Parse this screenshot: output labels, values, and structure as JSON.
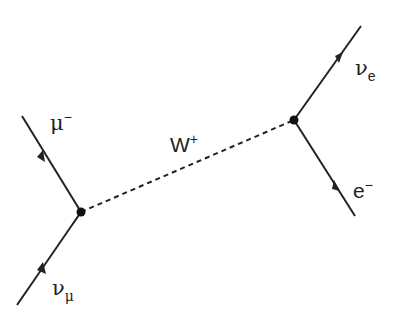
{
  "diagram": {
    "type": "feynman-diagram",
    "colors": {
      "line": "#222222",
      "background": "#ffffff"
    },
    "vertices": [
      {
        "id": "left-vertex",
        "x": 81,
        "y": 212
      },
      {
        "id": "right-vertex",
        "x": 294,
        "y": 120
      }
    ],
    "propagator": {
      "label_main": "W",
      "label_sup": "+",
      "style": "dashed"
    },
    "particles": {
      "muon": {
        "label_main": "μ",
        "label_sup": "−",
        "direction": "outgoing"
      },
      "muon_neutrino": {
        "label_main": "ν",
        "label_sub": "μ",
        "direction": "incoming"
      },
      "electron_neutrino": {
        "label_main": "ν",
        "label_sub": "e",
        "direction": "outgoing"
      },
      "electron": {
        "label_main": "e",
        "label_sup": "−",
        "direction": "incoming"
      }
    }
  }
}
